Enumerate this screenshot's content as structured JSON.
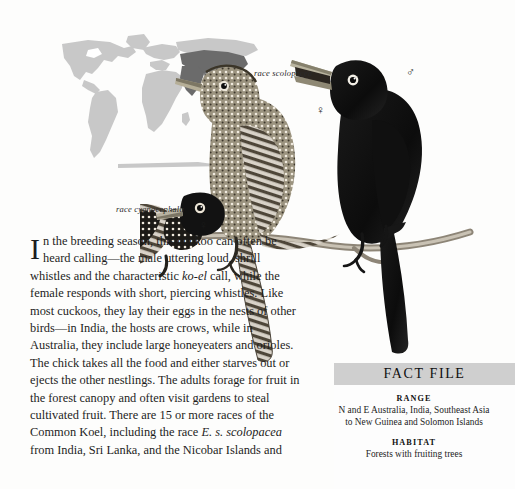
{
  "page": {
    "background_color": "#fdfdfc",
    "text_color": "#1d1d1d"
  },
  "map": {
    "name": "world-range-map",
    "land_color": "#c8c8c8",
    "range_color": "#6b6b6b",
    "description": "World map with species range highlighted across India, Southeast Asia, New Guinea and Australia"
  },
  "illustration": {
    "name": "common-koel-plate",
    "description": "Three perched koels on a branch: black male at right, barred female centre, black-and-white spotted female at left"
  },
  "labels": {
    "race_scolopacea": "race scolopacea",
    "race_cyanocephala": "race cyanocephala",
    "female_symbol": "♀",
    "male_symbol": "♂"
  },
  "article": {
    "dropcap": "I",
    "paragraph_lead": "n the breeding season, this cuckoo can often be heard calling—the male uttering loud, shrill whistles and the characteristic ",
    "italic_call": "ko-el",
    "paragraph_mid": " call, while the female responds with short, piercing whistles. Like most cuckoos, they lay their eggs in the nests of other birds—in India, the hosts are crows, while in Australia, they include large honeyeaters and orioles. The chick takes all the food and either starves out or ejects the other nestlings. The adults forage for fruit in the forest canopy and often visit gardens to steal cultivated fruit. There are 15 or more races of the Common Koel, including the race ",
    "italic_race": "E. s. scolopacea",
    "paragraph_end": " from India, Sri Lanka, and the Nicobar Islands and"
  },
  "fact_file": {
    "title": "FACT FILE",
    "header_color": "#cfcfcf",
    "sections": [
      {
        "label": "RANGE",
        "value": "N and E Australia, India, Southeast Asia to New Guinea and Solomon Islands"
      },
      {
        "label": "HABITAT",
        "value": "Forests with fruiting trees"
      }
    ]
  }
}
